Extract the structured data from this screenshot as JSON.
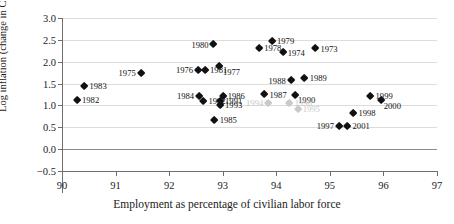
{
  "chart_data": {
    "type": "scatter",
    "title": "",
    "xlabel": "Employment as percentage of civilian labor force",
    "ylabel": "Log inflation (change in CPI)",
    "xlim": [
      90,
      97
    ],
    "ylim": [
      -0.5,
      3.0
    ],
    "xticks": [
      "90",
      "91",
      "92",
      "93",
      "94",
      "95",
      "96",
      "97"
    ],
    "yticks": [
      "3.0",
      "2.5",
      "2.0",
      "1.5",
      "1.0",
      "0.5",
      "0.0",
      "-0.5"
    ],
    "grid": true,
    "legend": "none",
    "points": [
      {
        "label": "1973",
        "x": 94.73,
        "y": 2.3,
        "faded": false,
        "pos": "right"
      },
      {
        "label": "1974",
        "x": 94.12,
        "y": 2.21,
        "faded": false,
        "pos": "right"
      },
      {
        "label": "1975",
        "x": 91.47,
        "y": 1.74,
        "faded": false,
        "pos": "left"
      },
      {
        "label": "1976",
        "x": 92.54,
        "y": 1.81,
        "faded": false,
        "pos": "left"
      },
      {
        "label": "1977",
        "x": 92.93,
        "y": 1.9,
        "faded": false,
        "pos": "below"
      },
      {
        "label": "1978",
        "x": 93.68,
        "y": 2.32,
        "faded": false,
        "pos": "right"
      },
      {
        "label": "1979",
        "x": 93.92,
        "y": 2.48,
        "faded": false,
        "pos": "right"
      },
      {
        "label": "1980",
        "x": 92.83,
        "y": 2.39,
        "faded": false,
        "pos": "left"
      },
      {
        "label": "1981",
        "x": 92.67,
        "y": 1.8,
        "faded": false,
        "pos": "right"
      },
      {
        "label": "1982",
        "x": 90.28,
        "y": 1.12,
        "faded": false,
        "pos": "right"
      },
      {
        "label": "1983",
        "x": 90.42,
        "y": 1.44,
        "faded": false,
        "pos": "right"
      },
      {
        "label": "1984",
        "x": 92.56,
        "y": 1.22,
        "faded": false,
        "pos": "left"
      },
      {
        "label": "1985",
        "x": 92.85,
        "y": 0.67,
        "faded": false,
        "pos": "right"
      },
      {
        "label": "1986",
        "x": 93.0,
        "y": 1.22,
        "faded": false,
        "pos": "right"
      },
      {
        "label": "1987",
        "x": 93.78,
        "y": 1.25,
        "faded": false,
        "pos": "right"
      },
      {
        "label": "1988",
        "x": 94.27,
        "y": 1.57,
        "faded": false,
        "pos": "left"
      },
      {
        "label": "1989",
        "x": 94.53,
        "y": 1.62,
        "faded": false,
        "pos": "right"
      },
      {
        "label": "1990",
        "x": 94.35,
        "y": 1.24,
        "faded": false,
        "pos": "br"
      },
      {
        "label": "1991",
        "x": 92.95,
        "y": 1.1,
        "faded": false,
        "pos": "right"
      },
      {
        "label": "1992",
        "x": 92.64,
        "y": 1.09,
        "faded": false,
        "pos": "right"
      },
      {
        "label": "1993",
        "x": 92.95,
        "y": 1.0,
        "faded": false,
        "pos": "right"
      },
      {
        "label": "1994",
        "x": 93.85,
        "y": 1.06,
        "faded": true,
        "pos": "left"
      },
      {
        "label": "1995",
        "x": 94.4,
        "y": 0.92,
        "faded": true,
        "pos": "right"
      },
      {
        "label": "1996",
        "x": 94.25,
        "y": 1.05,
        "faded": true,
        "pos": "right"
      },
      {
        "label": "1997",
        "x": 95.17,
        "y": 0.52,
        "faded": false,
        "pos": "left"
      },
      {
        "label": "1998",
        "x": 95.44,
        "y": 0.82,
        "faded": false,
        "pos": "right"
      },
      {
        "label": "1999",
        "x": 95.76,
        "y": 1.21,
        "faded": false,
        "pos": "right"
      },
      {
        "label": "2000",
        "x": 95.95,
        "y": 1.11,
        "faded": false,
        "pos": "br"
      },
      {
        "label": "2001",
        "x": 95.33,
        "y": 0.53,
        "faded": false,
        "pos": "right"
      }
    ]
  }
}
